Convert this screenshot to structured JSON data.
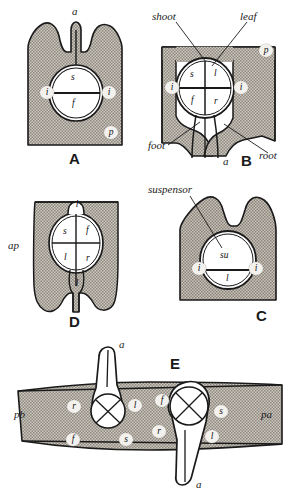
{
  "figure": {
    "colors": {
      "stipple_fill": "#b3aea6",
      "outline": "#1a1a1a",
      "background": "#ffffff",
      "halo": "#f3f1ee"
    }
  },
  "panels": [
    {
      "id": "A",
      "letter": "A",
      "top_label": "a",
      "inner_labels": [
        "s",
        "f"
      ],
      "side_labels": [
        "i",
        "i"
      ],
      "tissue_labels": [
        "p"
      ]
    },
    {
      "id": "B",
      "letter": "B",
      "bottom_label": "a",
      "callouts": [
        "shoot",
        "leaf",
        "foot",
        "root"
      ],
      "inner_labels": [
        "s",
        "l",
        "f",
        "r"
      ],
      "side_labels": [
        "i",
        "i"
      ],
      "tissue_labels": [
        "p"
      ]
    },
    {
      "id": "C",
      "letter": "C",
      "callouts": [
        "suspensor"
      ],
      "inner_labels": [
        "su",
        "l"
      ],
      "side_labels": [
        "i",
        "i"
      ],
      "tissue_labels": []
    },
    {
      "id": "D",
      "letter": "D",
      "inner_labels": [
        "s",
        "f",
        "l",
        "r"
      ],
      "outer_labels": [
        "l",
        "l"
      ],
      "tissue_labels": [
        "ap"
      ]
    },
    {
      "id": "E",
      "letter": "E",
      "tissue_labels": [
        "pb",
        "pa"
      ],
      "embryo_left": {
        "apex_label": "a",
        "surround_labels": [
          "r",
          "l",
          "f",
          "s"
        ]
      },
      "embryo_right": {
        "apex_label": "a",
        "surround_labels": [
          "f",
          "s",
          "r",
          "l"
        ]
      }
    }
  ],
  "labels": {
    "a": "a",
    "s": "s",
    "f": "f",
    "l": "l",
    "r": "r",
    "i": "i",
    "p": "p",
    "su": "su",
    "ap": "ap",
    "pb": "pb",
    "pa": "pa",
    "shoot": "shoot",
    "leaf": "leaf",
    "foot": "foot",
    "root": "root",
    "suspensor": "suspensor",
    "A": "A",
    "B": "B",
    "C": "C",
    "D": "D",
    "E": "E"
  }
}
